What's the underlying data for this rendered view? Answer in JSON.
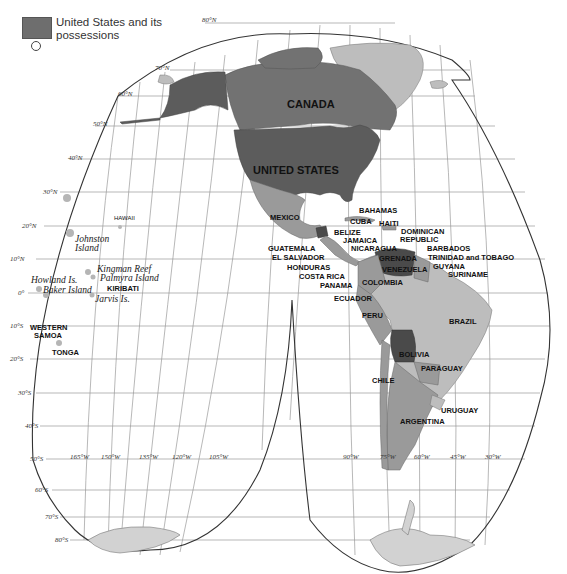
{
  "legend": {
    "swatch_label": "United States and its possessions",
    "swatch_color": "#6e6e6e",
    "circle_note": ""
  },
  "latitude_ticks": [
    "80°N",
    "70°N",
    "60°N",
    "50°N",
    "40°N",
    "30°N",
    "20°N",
    "10°N",
    "0°",
    "10°S",
    "20°S",
    "30°S",
    "40°S",
    "50°S",
    "60°S",
    "70°S",
    "80°S"
  ],
  "longitude_ticks_left": [
    "165°W",
    "150°W",
    "135°W",
    "120°W",
    "105°W"
  ],
  "longitude_ticks_right": [
    "90°W",
    "75°W",
    "60°W",
    "45°W",
    "30°W"
  ],
  "countries": {
    "canada": "CANADA",
    "united_states": "UNITED STATES",
    "mexico": "MEXICO",
    "bahamas": "BAHAMAS",
    "cuba": "CUBA",
    "haiti": "HAITI",
    "dominican_republic_1": "DOMINICAN",
    "dominican_republic_2": "REPUBLIC",
    "belize": "BELIZE",
    "jamaica": "JAMAICA",
    "nicaragua": "NICARAGUA",
    "guatemala": "GUATEMALA",
    "el_salvador": "EL SALVADOR",
    "honduras": "HONDURAS",
    "costa_rica": "COSTA RICA",
    "panama": "PANAMA",
    "grenada": "GRENADA",
    "barbados": "BARBADOS",
    "trinidad_tobago": "TRINIDAD and TOBAGO",
    "guyana": "GUYANA",
    "suriname": "SURINAME",
    "venezuela": "VENEZUELA",
    "colombia": "COLOMBIA",
    "ecuador": "ECUADOR",
    "peru": "PERU",
    "brazil": "BRAZIL",
    "bolivia": "BOLIVIA",
    "paraguay": "PARAGUAY",
    "chile": "CHILE",
    "uruguay": "URUGUAY",
    "argentina": "ARGENTINA"
  },
  "pacific": {
    "hawaii": "HAWAII",
    "johnston_1": "Johnston",
    "johnston_2": "Island",
    "kingman": "Kingman Reef",
    "palmyra": "Palmyra Island",
    "kiribati": "KIRIBATI",
    "howland": "Howland Is.",
    "baker": "Baker Island",
    "jarvis": "Jarvis Is.",
    "western_samoa_1": "WESTERN",
    "western_samoa_2": "SAMOA",
    "tonga": "TONGA"
  }
}
